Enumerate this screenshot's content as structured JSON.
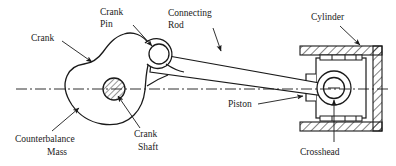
{
  "figure": {
    "type": "engineering-line-diagram",
    "background_color": "#ffffff",
    "line_color": "#1a1a1a",
    "centerline_color": "#1a1a1a"
  },
  "labels": {
    "crank_pin_line1": "Crank",
    "crank_pin_line2": "Pin",
    "connecting_rod_line1": "Connecting",
    "connecting_rod_line2": "Rod",
    "cylinder": "Cylinder",
    "crank": "Crank",
    "piston": "Piston",
    "counterbalance_line1": "Counterbalance",
    "counterbalance_line2": "Mass",
    "crank_shaft_line1": "Crank",
    "crank_shaft_line2": "Shaft",
    "crosshead": "Crosshead"
  },
  "parts": {
    "crank_web": "crank-web-outline",
    "crank_pin": "crank-pin-circle",
    "crank_shaft": "crank-shaft-hatched-circle",
    "connecting_rod": "connecting-rod-tapered-bar",
    "piston": "piston-block",
    "piston_rings": "piston-ring-grooves",
    "crosshead_pin": "crosshead-pin-circle",
    "cylinder": "cylinder-hatched-walls",
    "centerline": "horizontal-centerline-dash-dot"
  },
  "leaders": {
    "crank_pin": "leader-line-to-crank-pin",
    "connecting_rod": "leader-line-to-connecting-rod",
    "cylinder": "leader-line-to-cylinder-wall",
    "crank": "leader-line-to-crank-web",
    "piston": "leader-line-to-piston",
    "counterbalance": "leader-line-to-counterbalance-mass",
    "crank_shaft": "leader-line-to-crank-shaft",
    "crosshead": "leader-line-to-crosshead-pin"
  }
}
